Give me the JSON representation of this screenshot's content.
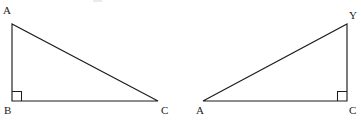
{
  "figure": {
    "background_color": "#ffffff",
    "stroke_color": "#1c1c1c",
    "label_color": "#1c1c1c",
    "triangles": [
      {
        "id": "left-triangle",
        "name": "triangle-ABC",
        "right_angle_at": "B",
        "vertices": [
          {
            "key": "apex",
            "label": "A",
            "x": 12,
            "y": 24,
            "label_x": 3,
            "label_y": 5
          },
          {
            "key": "right_angle",
            "label": "B",
            "x": 12,
            "y": 101,
            "label_x": 4,
            "label_y": 105
          },
          {
            "key": "base_end",
            "label": "C",
            "x": 158,
            "y": 101,
            "label_x": 161,
            "label_y": 105
          }
        ],
        "edges": [
          {
            "name": "leg-vertical-AB",
            "from": "A",
            "to": "B"
          },
          {
            "name": "leg-horizontal-BC",
            "from": "B",
            "to": "C"
          },
          {
            "name": "hypotenuse-AC",
            "from": "A",
            "to": "C"
          }
        ],
        "right_angle_marker": {
          "x": 12,
          "y": 101,
          "size": 10,
          "direction": "up-right"
        }
      },
      {
        "id": "right-triangle",
        "name": "triangle-AYC",
        "right_angle_at": "C",
        "vertices": [
          {
            "key": "apex",
            "label": "Y",
            "x": 347,
            "y": 24,
            "label_x": 349,
            "label_y": 10
          },
          {
            "key": "base_end",
            "label": "A",
            "x": 203,
            "y": 101,
            "label_x": 196,
            "label_y": 105
          },
          {
            "key": "right_angle",
            "label": "C",
            "x": 347,
            "y": 101,
            "label_x": 349,
            "label_y": 105
          }
        ],
        "edges": [
          {
            "name": "leg-vertical-YC",
            "from": "Y",
            "to": "C"
          },
          {
            "name": "leg-horizontal-AC",
            "from": "A",
            "to": "C"
          },
          {
            "name": "hypotenuse-AY",
            "from": "A",
            "to": "Y"
          }
        ],
        "right_angle_marker": {
          "x": 347,
          "y": 101,
          "size": 10,
          "direction": "up-left"
        }
      }
    ]
  }
}
